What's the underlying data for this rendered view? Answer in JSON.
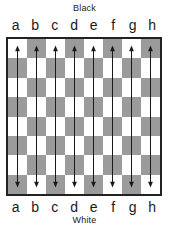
{
  "diagram": {
    "side_top_label": "Black",
    "side_bottom_label": "White",
    "files": [
      "a",
      "b",
      "c",
      "d",
      "e",
      "f",
      "g",
      "h"
    ],
    "ranks": [
      "8",
      "7",
      "6",
      "5",
      "4",
      "3",
      "2",
      "1"
    ],
    "colors": {
      "light_square": "#ffffff",
      "dark_square": "#9b9b9b",
      "border": "#222222",
      "arrow": "#1a1a1a",
      "background": "#ffffff",
      "text": "#1a1a1a"
    },
    "board": {
      "size": 8,
      "top_left_square_color": "light",
      "squares": [
        [
          "light",
          "dark",
          "light",
          "dark",
          "light",
          "dark",
          "light",
          "dark"
        ],
        [
          "dark",
          "light",
          "dark",
          "light",
          "dark",
          "light",
          "dark",
          "light"
        ],
        [
          "light",
          "dark",
          "light",
          "dark",
          "light",
          "dark",
          "light",
          "dark"
        ],
        [
          "dark",
          "light",
          "dark",
          "light",
          "dark",
          "light",
          "dark",
          "light"
        ],
        [
          "light",
          "dark",
          "light",
          "dark",
          "light",
          "dark",
          "light",
          "dark"
        ],
        [
          "dark",
          "light",
          "dark",
          "light",
          "dark",
          "light",
          "dark",
          "light"
        ],
        [
          "light",
          "dark",
          "light",
          "dark",
          "light",
          "dark",
          "light",
          "dark"
        ],
        [
          "dark",
          "light",
          "dark",
          "light",
          "dark",
          "light",
          "dark",
          "light"
        ]
      ]
    },
    "arrows": {
      "count": 8,
      "orientation": "vertical",
      "style": "double-headed",
      "from_rank": "8",
      "to_rank": "1",
      "items": [
        {
          "file": "a",
          "label": "a8-a1"
        },
        {
          "file": "b",
          "label": "b8-b1"
        },
        {
          "file": "c",
          "label": "c8-c1"
        },
        {
          "file": "d",
          "label": "d8-d1"
        },
        {
          "file": "e",
          "label": "e8-e1"
        },
        {
          "file": "f",
          "label": "f8-f1"
        },
        {
          "file": "g",
          "label": "g8-g1"
        },
        {
          "file": "h",
          "label": "h8-h1"
        }
      ]
    }
  }
}
